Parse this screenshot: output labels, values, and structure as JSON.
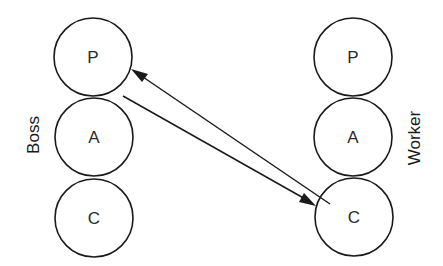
{
  "diagram": {
    "type": "agent-state interaction",
    "groups": [
      {
        "label": "Boss",
        "nodes": [
          {
            "id": "boss-p",
            "label": "P",
            "cx": 93,
            "cy": 57
          },
          {
            "id": "boss-a",
            "label": "A",
            "cx": 94,
            "cy": 137
          },
          {
            "id": "boss-c",
            "label": "C",
            "cx": 94,
            "cy": 218
          }
        ]
      },
      {
        "label": "Worker",
        "nodes": [
          {
            "id": "worker-p",
            "label": "P",
            "cx": 353,
            "cy": 57
          },
          {
            "id": "worker-a",
            "label": "A",
            "cx": 353,
            "cy": 137
          },
          {
            "id": "worker-c",
            "label": "C",
            "cx": 354,
            "cy": 217
          }
        ]
      }
    ],
    "edges": [
      {
        "from": "boss-p",
        "to": "worker-c",
        "direction": "boss-to-worker"
      },
      {
        "from": "worker-c",
        "to": "boss-p",
        "direction": "worker-to-boss"
      }
    ],
    "colors": {
      "stroke": "#1a1a1a",
      "background": "#ffffff"
    }
  }
}
